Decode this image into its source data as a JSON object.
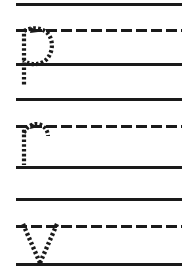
{
  "worksheet": {
    "title": "Handwriting Tracing Practice Worksheet",
    "page_width": 194,
    "page_height": 272,
    "background_color": "#ffffff",
    "ink_color": "#1a1a1a",
    "rule_left_x": 16,
    "rule_right_x": 182,
    "solid_rule_thickness": 3,
    "dashed_rule_thickness": 3,
    "dash_length": 11,
    "dash_gap": 4,
    "trace_dot_size": 2.6,
    "trace_dot_gap": 2.2
  },
  "rules": [
    {
      "id": "rule-1",
      "kind": "solid",
      "y": 3,
      "label": "topline-1"
    },
    {
      "id": "rule-2",
      "kind": "dashed",
      "y": 29,
      "label": "midline-1"
    },
    {
      "id": "rule-3",
      "kind": "solid",
      "y": 63,
      "label": "baseline-1"
    },
    {
      "id": "rule-4",
      "kind": "solid",
      "y": 98,
      "label": "topline-2"
    },
    {
      "id": "rule-5",
      "kind": "dashed",
      "y": 125,
      "label": "midline-2"
    },
    {
      "id": "rule-6",
      "kind": "solid",
      "y": 166,
      "label": "baseline-2"
    },
    {
      "id": "rule-7",
      "kind": "solid",
      "y": 198,
      "label": "topline-3"
    },
    {
      "id": "rule-8",
      "kind": "dashed",
      "y": 225,
      "label": "midline-3"
    },
    {
      "id": "rule-9",
      "kind": "solid",
      "y": 263,
      "label": "baseline-3"
    }
  ],
  "letters": [
    {
      "id": "trace-letter-p",
      "character": "p",
      "case": "lowercase",
      "row": 1,
      "style": "dotted-trace",
      "x": 18,
      "y": 26,
      "width": 42,
      "height": 56,
      "midline_y": 29,
      "baseline_y": 63,
      "descender_y": 82,
      "has_arrow": true,
      "arrow_label": "start-stroke-arrow"
    },
    {
      "id": "trace-letter-r",
      "character": "r",
      "case": "lowercase",
      "row": 2,
      "style": "dotted-trace",
      "x": 18,
      "y": 122,
      "width": 38,
      "height": 46,
      "midline_y": 125,
      "baseline_y": 166,
      "has_arrow": true,
      "arrow_label": "start-stroke-arrow"
    },
    {
      "id": "trace-letter-v",
      "character": "V",
      "case": "uppercase",
      "row": 3,
      "style": "dotted-trace",
      "x": 20,
      "y": 222,
      "width": 42,
      "height": 44,
      "midline_y": 225,
      "baseline_y": 263,
      "has_arrow": false,
      "arrow_label": ""
    }
  ]
}
